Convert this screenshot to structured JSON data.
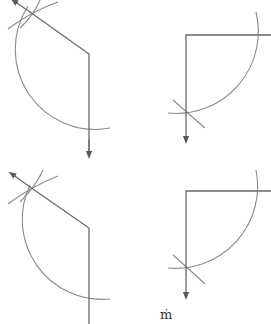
{
  "diagram": {
    "colors": {
      "line": "#6a6a6a",
      "arc": "#8a8a8a",
      "background": "#ffffff"
    },
    "panels": [
      {
        "id": "top-left",
        "type": "obtuse-turn-up-left"
      },
      {
        "id": "top-right",
        "type": "right-angle-turn-down"
      },
      {
        "id": "bottom-left",
        "type": "obtuse-turn-up-left"
      },
      {
        "id": "bottom-right",
        "type": "right-angle-turn-down"
      }
    ],
    "bottom_label": "ṁ"
  }
}
